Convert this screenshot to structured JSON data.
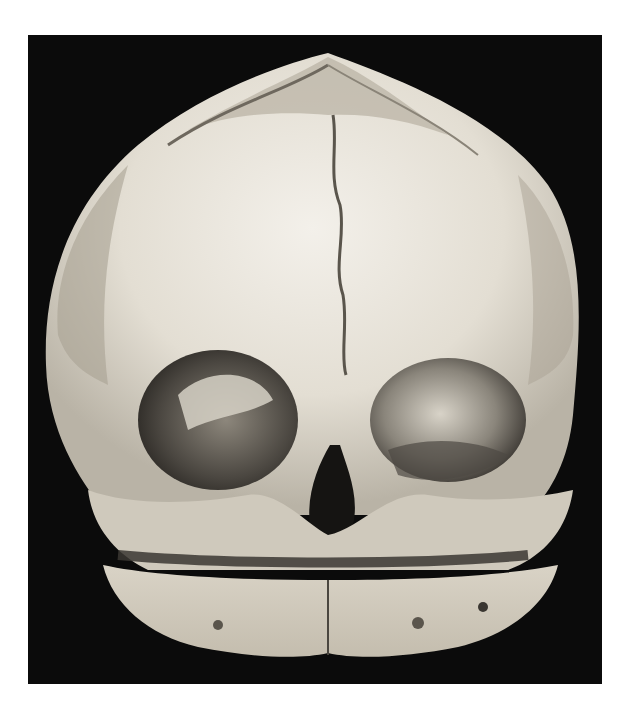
{
  "image": {
    "subject": "infant-skull-frontal-view",
    "background_color": "#0b0b0b",
    "page_color": "#ffffff",
    "bone_color": "#e6e1d6",
    "shadow_color": "#2a2723"
  }
}
